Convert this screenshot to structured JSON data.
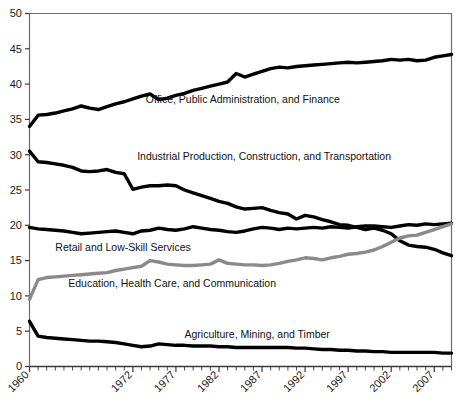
{
  "chart_data": {
    "type": "line",
    "title": "",
    "xlabel": "",
    "ylabel": "",
    "xlim": [
      1960,
      2009
    ],
    "ylim": [
      0,
      50
    ],
    "grid": false,
    "legend_position": "inline-annotations",
    "y_ticks": [
      0,
      5,
      10,
      15,
      20,
      25,
      30,
      35,
      40,
      45,
      50
    ],
    "x_ticks_labeled": [
      1960,
      1972,
      1977,
      1982,
      1987,
      1992,
      1997,
      2002,
      2007
    ],
    "x_tick_interval_minor": 1,
    "x": [
      1960,
      1961,
      1962,
      1963,
      1964,
      1965,
      1966,
      1967,
      1968,
      1969,
      1970,
      1971,
      1972,
      1973,
      1974,
      1975,
      1976,
      1977,
      1978,
      1979,
      1980,
      1981,
      1982,
      1983,
      1984,
      1985,
      1986,
      1987,
      1988,
      1989,
      1990,
      1991,
      1992,
      1993,
      1994,
      1995,
      1996,
      1997,
      1998,
      1999,
      2000,
      2001,
      2002,
      2003,
      2004,
      2005,
      2006,
      2007,
      2008,
      2009
    ],
    "series": [
      {
        "name": "Office, Public Administration, and Finance",
        "color": "#000000",
        "label_x": 1973.5,
        "label_y": 37.3,
        "values": [
          34.0,
          35.6,
          35.7,
          35.9,
          36.2,
          36.5,
          36.9,
          36.6,
          36.4,
          36.8,
          37.2,
          37.5,
          37.9,
          38.3,
          38.6,
          37.8,
          38.0,
          38.4,
          38.7,
          39.1,
          39.4,
          39.7,
          40.0,
          40.3,
          41.5,
          41.0,
          41.4,
          41.8,
          42.2,
          42.4,
          42.3,
          42.5,
          42.6,
          42.7,
          42.8,
          42.9,
          43.0,
          43.1,
          43.0,
          43.1,
          43.2,
          43.3,
          43.5,
          43.4,
          43.5,
          43.3,
          43.4,
          43.8,
          44.0,
          44.2
        ]
      },
      {
        "name": "Industrial Production, Construction, and Transportation",
        "color": "#000000",
        "label_x": 1972.5,
        "label_y": 29.2,
        "values": [
          30.5,
          29.0,
          28.9,
          28.7,
          28.5,
          28.2,
          27.7,
          27.6,
          27.7,
          27.9,
          27.5,
          27.3,
          25.1,
          25.4,
          25.6,
          25.6,
          25.7,
          25.6,
          25.0,
          24.6,
          24.2,
          23.8,
          23.4,
          23.1,
          22.6,
          22.3,
          22.4,
          22.5,
          22.1,
          21.8,
          21.6,
          20.9,
          21.4,
          21.2,
          20.8,
          20.5,
          20.1,
          20.0,
          19.7,
          19.4,
          19.6,
          19.3,
          18.8,
          17.8,
          17.2,
          17.0,
          16.9,
          16.6,
          16.1,
          15.7
        ]
      },
      {
        "name": "Retail and Low-Skill Services",
        "color": "#000000",
        "label_x": 1963.0,
        "label_y": 16.4,
        "values": [
          19.7,
          19.5,
          19.4,
          19.3,
          19.2,
          19.0,
          18.8,
          18.9,
          19.0,
          19.1,
          19.2,
          19.0,
          18.8,
          19.2,
          19.3,
          19.6,
          19.4,
          19.3,
          19.5,
          19.8,
          19.6,
          19.4,
          19.3,
          19.1,
          19.0,
          19.2,
          19.5,
          19.7,
          19.6,
          19.4,
          19.6,
          19.5,
          19.6,
          19.7,
          19.6,
          19.8,
          19.7,
          19.6,
          19.8,
          19.9,
          19.9,
          19.8,
          19.7,
          19.9,
          20.1,
          20.0,
          20.2,
          20.1,
          20.2,
          20.3
        ]
      },
      {
        "name": "Education, Health Care, and Communication",
        "color": "#8a8a8a",
        "label_x": 1964.5,
        "label_y": 11.2,
        "values": [
          9.5,
          12.3,
          12.6,
          12.7,
          12.8,
          12.9,
          13.0,
          13.1,
          13.2,
          13.3,
          13.6,
          13.8,
          14.0,
          14.2,
          15.0,
          14.8,
          14.5,
          14.4,
          14.3,
          14.3,
          14.4,
          14.5,
          15.1,
          14.6,
          14.5,
          14.4,
          14.4,
          14.3,
          14.4,
          14.6,
          14.9,
          15.1,
          15.4,
          15.3,
          15.1,
          15.4,
          15.6,
          15.9,
          16.0,
          16.2,
          16.5,
          17.0,
          17.6,
          18.2,
          18.5,
          18.6,
          19.0,
          19.4,
          19.8,
          20.2
        ]
      },
      {
        "name": "Agriculture, Mining, and Timber",
        "color": "#000000",
        "label_x": 1978.0,
        "label_y": 4.0,
        "values": [
          6.4,
          4.3,
          4.1,
          4.0,
          3.9,
          3.8,
          3.7,
          3.6,
          3.6,
          3.5,
          3.4,
          3.2,
          3.0,
          2.8,
          2.9,
          3.2,
          3.1,
          3.0,
          3.0,
          2.9,
          2.9,
          2.9,
          2.8,
          2.8,
          2.7,
          2.7,
          2.7,
          2.7,
          2.7,
          2.7,
          2.7,
          2.6,
          2.6,
          2.5,
          2.4,
          2.4,
          2.3,
          2.3,
          2.2,
          2.2,
          2.1,
          2.1,
          2.0,
          2.0,
          2.0,
          2.0,
          2.0,
          2.0,
          1.9,
          1.9
        ]
      }
    ]
  },
  "axes": {
    "y_labels": [
      "0",
      "5",
      "10",
      "15",
      "20",
      "25",
      "30",
      "35",
      "40",
      "45",
      "50"
    ],
    "x_labels": [
      "1960",
      "1972",
      "1977",
      "1982",
      "1987",
      "1992",
      "1997",
      "2002",
      "2007"
    ]
  },
  "colors": {
    "line_dark": "#000000",
    "line_gray": "#8a8a8a",
    "axis": "#6b6b6b",
    "background": "#ffffff",
    "text": "#1a1a1a"
  }
}
